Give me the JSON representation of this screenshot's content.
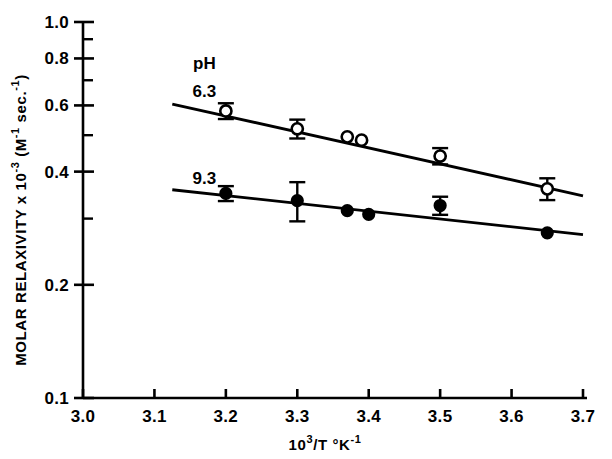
{
  "chart_data": {
    "type": "scatter",
    "title": "",
    "xlabel": "10^3/T  °K^-1",
    "xlabel_parts": {
      "base": "10",
      "exp": "3",
      "mid": "/T  °K",
      "exp2": "-1"
    },
    "ylabel": "MOLAR RELAXIVITY x 10^-3  (M^-1 sec.^-1)",
    "ylabel_parts": {
      "p1": "MOLAR RELAXIVITY x 10",
      "e1": "-3",
      "p2": " (M",
      "e2": "-1",
      "p3": " sec.",
      "e3": "-1",
      "p4": ")"
    },
    "xscale": "linear",
    "yscale": "log",
    "xlim": [
      3.0,
      3.7
    ],
    "ylim": [
      0.1,
      1.0
    ],
    "grid": false,
    "legend_position": "inside-upper-left",
    "xticks": [
      "3.0",
      "3.1",
      "3.2",
      "3.3",
      "3.4",
      "3.5",
      "3.6",
      "3.7"
    ],
    "xtick_values": [
      3.0,
      3.1,
      3.2,
      3.3,
      3.4,
      3.5,
      3.6,
      3.7
    ],
    "yticks": [
      "1.0",
      "0.8",
      "0.6",
      "0.4",
      "0.2",
      "0.1"
    ],
    "ytick_values": [
      1.0,
      0.8,
      0.6,
      0.4,
      0.2,
      0.1
    ],
    "yminor_values": [
      0.9,
      0.7,
      0.5,
      0.3
    ],
    "annotations": [
      {
        "text": "pH",
        "x": 3.17,
        "y": 0.78
      },
      {
        "text": "6.3",
        "x": 3.17,
        "y": 0.655
      },
      {
        "text": "9.3",
        "x": 3.17,
        "y": 0.385
      }
    ],
    "series": [
      {
        "name": "pH 6.3",
        "marker": "open-circle",
        "x": [
          3.2,
          3.3,
          3.37,
          3.39,
          3.5,
          3.65
        ],
        "values": [
          0.58,
          0.52,
          0.495,
          0.485,
          0.44,
          0.36
        ],
        "yerr": [
          0.028,
          0.03,
          0.0,
          0.0,
          0.022,
          0.024
        ],
        "fit_line": {
          "x": [
            3.125,
            3.7
          ],
          "y": [
            0.605,
            0.345
          ]
        }
      },
      {
        "name": "pH 9.3",
        "marker": "filled-circle",
        "x": [
          3.2,
          3.3,
          3.37,
          3.4,
          3.5,
          3.65
        ],
        "values": [
          0.35,
          0.335,
          0.315,
          0.308,
          0.325,
          0.275
        ],
        "yerr": [
          0.016,
          0.04,
          0.0,
          0.0,
          0.018,
          0.0
        ],
        "fit_line": {
          "x": [
            3.125,
            3.7
          ],
          "y": [
            0.358,
            0.272
          ]
        }
      }
    ]
  }
}
